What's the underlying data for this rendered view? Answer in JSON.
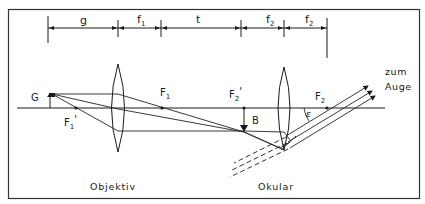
{
  "dimensions": {
    "g": "g",
    "f1": "f",
    "f1_sub": "1",
    "t": "t",
    "f2a": "f",
    "f2a_sub": "2",
    "f2b": "f",
    "f2b_sub": "2"
  },
  "points": {
    "G": "G",
    "F1": "F",
    "F1_sub": "1",
    "F1prime": "F",
    "F1prime_sub": "1",
    "F1prime_mark": "'",
    "F2prime": "F",
    "F2prime_sub": "2",
    "F2prime_mark": "'",
    "B": "B",
    "F2": "F",
    "F2_sub": "2",
    "epsilon": "ε"
  },
  "labels": {
    "objective": "Objektiv",
    "eyepiece": "Okular",
    "to_eye_line1": "zum",
    "to_eye_line2": "Auge"
  },
  "colors": {
    "ink": "#1a1a1a",
    "background": "#ffffff"
  }
}
